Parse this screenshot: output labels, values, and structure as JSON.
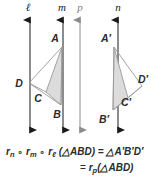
{
  "figure": {
    "canvas": {
      "width": 157,
      "height": 178
    },
    "colors": {
      "line_black": "#1a1a1a",
      "line_gray": "#8c8c8c",
      "shape_stroke": "#9a9a9a",
      "shape_fill": "#dcdcdc",
      "text": "#2b2b2b"
    },
    "lines": [
      {
        "id": "l",
        "label": "ℓ",
        "x": 30,
        "color": "black",
        "label_x": 28,
        "label_y": 11
      },
      {
        "id": "m",
        "label": "m",
        "x": 63,
        "color": "black",
        "label_x": 60,
        "label_y": 11
      },
      {
        "id": "p",
        "label": "p",
        "x": 80,
        "color": "gray",
        "label_x": 77,
        "label_y": 11
      },
      {
        "id": "n",
        "label": "n",
        "x": 118,
        "color": "black",
        "label_x": 115,
        "label_y": 11
      }
    ],
    "triangles": [
      {
        "id": "preimage",
        "shaded_label": "ABD",
        "vertices": [
          {
            "name": "A",
            "x": 62,
            "y": 47,
            "label_x": 55,
            "label_y": 42
          },
          {
            "name": "B",
            "x": 61,
            "y": 105,
            "label_x": 56,
            "label_y": 117
          },
          {
            "name": "C",
            "x": 46,
            "y": 92,
            "label_x": 36,
            "label_y": 101
          },
          {
            "name": "D",
            "x": 29,
            "y": 83,
            "label_x": 18,
            "label_y": 87
          }
        ]
      },
      {
        "id": "image",
        "shaded_label": "A'B'D'",
        "vertices": [
          {
            "name": "A′",
            "x": 114,
            "y": 47,
            "label_x": 104,
            "label_y": 42
          },
          {
            "name": "B′",
            "x": 113,
            "y": 110,
            "label_x": 100,
            "label_y": 122
          },
          {
            "name": "C′",
            "x": 128,
            "y": 98,
            "label_x": 122,
            "label_y": 103
          },
          {
            "name": "D′",
            "x": 142,
            "y": 86,
            "label_x": 137,
            "label_y": 83
          }
        ]
      }
    ],
    "equation": {
      "line1": {
        "segments": [
          {
            "text": "r",
            "style": "var"
          },
          {
            "text": "n",
            "style": "sub"
          },
          {
            "text": " ∘ ",
            "style": "op"
          },
          {
            "text": "r",
            "style": "var"
          },
          {
            "text": "m",
            "style": "sub"
          },
          {
            "text": " ∘ ",
            "style": "op"
          },
          {
            "text": "r",
            "style": "var"
          },
          {
            "text": "ℓ",
            "style": "sub"
          },
          {
            "text": " (△ABD) = △A′B′D′",
            "style": "var"
          }
        ],
        "plain": "rₙ ∘ rₘ ∘ rℓ (△ABD) = △A′B′D′"
      },
      "line2": {
        "segments": [
          {
            "text": "= ",
            "style": "op"
          },
          {
            "text": "r",
            "style": "var"
          },
          {
            "text": "p",
            "style": "sub"
          },
          {
            "text": "(△ABD)",
            "style": "var"
          }
        ],
        "plain": "= rₚ(△ABD)"
      }
    }
  }
}
